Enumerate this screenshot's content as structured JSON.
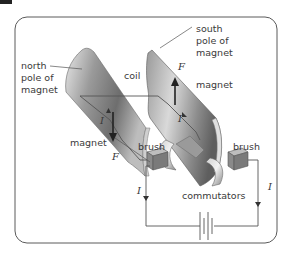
{
  "figure": {
    "type": "dc-motor-diagram",
    "frame_color": "#5a5a5a",
    "labels": {
      "north_pole": [
        "north",
        "pole of",
        "magnet"
      ],
      "south_pole": [
        "south",
        "pole of",
        "magnet"
      ],
      "coil": "coil",
      "magnet_left": "magnet",
      "magnet_right": "magnet",
      "brush_left": "brush",
      "brush_right": "brush",
      "commutators": "commutators"
    },
    "symbols": {
      "force_left": "F",
      "force_right": "F",
      "current_left_coil": "I",
      "current_right_coil": "I",
      "current_left_wire": "I",
      "current_right_wire": "I"
    },
    "components": [
      "north-magnet",
      "south-magnet",
      "coil",
      "commutators",
      "brushes",
      "battery"
    ]
  }
}
